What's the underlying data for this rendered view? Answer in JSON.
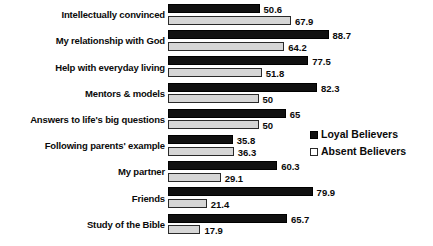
{
  "chart_data": {
    "type": "bar",
    "orientation": "horizontal",
    "title": "",
    "subtitle": "",
    "xlabel": "",
    "ylabel": "",
    "xlim": [
      0,
      88.7
    ],
    "grid": false,
    "legend_position": "right-middle",
    "categories": [
      "Intellectually convinced",
      "My relationship with God",
      "Help with everyday living",
      "Mentors & models",
      "Answers to life's big questions",
      "Following parents' example",
      "My partner",
      "Friends",
      "Study of the Bible"
    ],
    "series": [
      {
        "name": "Loyal Believers",
        "color": "#101010",
        "style": "filled",
        "values": [
          50.6,
          88.7,
          77.5,
          82.3,
          65,
          35.8,
          60.3,
          79.9,
          65.7
        ],
        "value_labels": [
          "50.6",
          "88.7",
          "77.5",
          "82.3",
          "65",
          "35.8",
          "60.3",
          "79.9",
          "65.7"
        ]
      },
      {
        "name": "Absent Believers",
        "color": "#d6d6d6",
        "style": "outlined",
        "values": [
          67.9,
          64.2,
          51.8,
          50,
          50,
          36.3,
          29.1,
          21.4,
          17.9
        ],
        "value_labels": [
          "67.9",
          "64.2",
          "51.8",
          "50",
          "50",
          "36.3",
          "29.1",
          "21.4",
          "17.9"
        ]
      }
    ],
    "legend": [
      {
        "label": "Loyal Believers",
        "swatch": "filled-black-square"
      },
      {
        "label": "Absent Believers",
        "swatch": "outlined-white-square"
      }
    ]
  }
}
